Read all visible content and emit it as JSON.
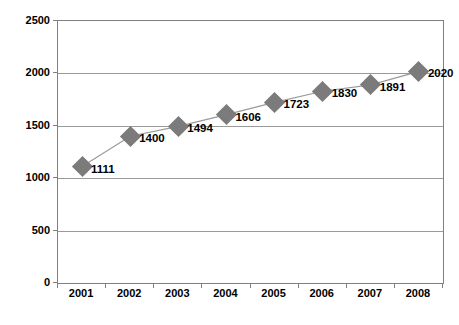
{
  "chart_data": {
    "type": "line",
    "title": "",
    "subtitle": "",
    "xlabel": "",
    "ylabel": "",
    "categories": [
      "2001",
      "2002",
      "2003",
      "2004",
      "2005",
      "2006",
      "2007",
      "2008"
    ],
    "values": [
      1111,
      1400,
      1494,
      1606,
      1723,
      1830,
      1891,
      2020
    ],
    "point_labels": [
      "1111",
      "1400",
      "1494",
      "1606",
      "1723",
      "1830",
      "1891",
      "2020"
    ],
    "ylim": [
      0,
      2500
    ],
    "yticks": [
      0,
      500,
      1000,
      1500,
      2000,
      2500
    ],
    "ytick_labels": [
      "0",
      "500",
      "1000",
      "1500",
      "2000",
      "2500"
    ],
    "xtick_labels": [
      "2001",
      "2002",
      "2003",
      "2004",
      "2005",
      "2006",
      "2007",
      "2008"
    ],
    "grid": true,
    "grid_axis": "y",
    "legend": false,
    "legend_position": "none",
    "marker": "diamond",
    "marker_color": "#7b7b7b",
    "line_color": "#9a9a9a",
    "axis_color": "#808080",
    "background_color": "#ffffff",
    "text_color": "#000000"
  }
}
